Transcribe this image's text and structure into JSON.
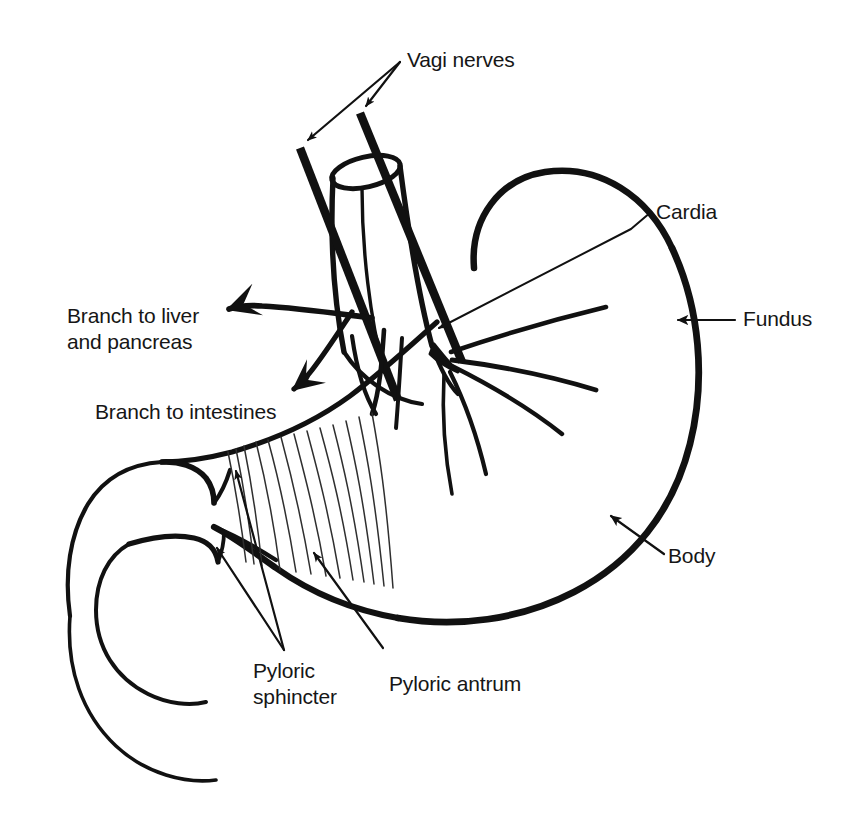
{
  "figure": {
    "kind": "anatomical-line-drawing",
    "background_color": "#ffffff",
    "ink_color": "#111111",
    "rugae_color": "#2b2b2b",
    "width": 846,
    "height": 821
  },
  "labels": {
    "vagi_nerves": "Vagi nerves",
    "cardia": "Cardia",
    "fundus": "Fundus",
    "body": "Body",
    "branch_liver_line1": "Branch to liver",
    "branch_liver_line2": "and pancreas",
    "branch_intestines": "Branch to intestines",
    "pyloric_sphincter_line1": "Pyloric",
    "pyloric_sphincter_line2": "sphincter",
    "pyloric_antrum": "Pyloric antrum"
  },
  "structures": [
    {
      "name": "esophagus",
      "description": "open-topped cylinder entering stomach from above"
    },
    {
      "name": "vagus-nerve-anterior-trunk",
      "description": "thick straight nerve trunk left of esophagus"
    },
    {
      "name": "vagus-nerve-posterior-trunk",
      "description": "thick straight nerve trunk crossing the esophagus"
    },
    {
      "name": "fundus",
      "description": "rounded upper-left dome of the stomach"
    },
    {
      "name": "body",
      "description": "large central chamber, greater curvature on the right"
    },
    {
      "name": "pyloric-antrum",
      "description": "narrowing lower region with gastric rugae folds"
    },
    {
      "name": "pyloric-sphincter",
      "description": "two notched constrictions at stomach outlet"
    },
    {
      "name": "duodenum",
      "description": "curled tube leaving the pylorus to the lower left"
    },
    {
      "name": "gastric-rugae",
      "description": "fine parallel fold lines inside the antrum"
    },
    {
      "name": "nerve-branch-fan",
      "description": "five nerve branches fanning right from the cardia"
    },
    {
      "name": "nerve-branch-to-liver-and-pancreas",
      "description": "branch exiting left with arrowhead"
    },
    {
      "name": "nerve-branch-to-intestines",
      "description": "branch descending left with arrowhead"
    }
  ],
  "leaders": [
    {
      "name": "vagi-nerves-double-leader",
      "label": "Vagi nerves",
      "style": "forked double arrow"
    },
    {
      "name": "cardia-leader",
      "label": "Cardia",
      "style": "single arrow"
    },
    {
      "name": "fundus-leader",
      "label": "Fundus",
      "style": "single arrow"
    },
    {
      "name": "body-leader",
      "label": "Body",
      "style": "single arrow"
    },
    {
      "name": "pyloric-sphincter-double-leader",
      "label": "Pyloric sphincter",
      "style": "two arrows"
    },
    {
      "name": "pyloric-antrum-leader",
      "label": "Pyloric antrum",
      "style": "plain pointer line"
    }
  ]
}
